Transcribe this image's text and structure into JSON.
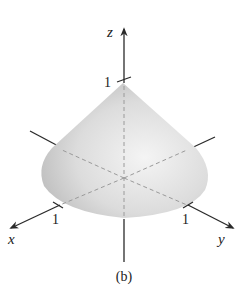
{
  "figure": {
    "caption": "(b)",
    "axes": {
      "x": {
        "label": "x",
        "tick_label": "1"
      },
      "y": {
        "label": "y",
        "tick_label": "1"
      },
      "z": {
        "label": "z",
        "tick_label": "1"
      }
    },
    "surface": "cone",
    "colors": {
      "axis": "#2a2a2a",
      "cone_light": "#f2f2f2",
      "cone_dark": "#b8b8b8",
      "dashed": "#9a9a9a"
    }
  }
}
